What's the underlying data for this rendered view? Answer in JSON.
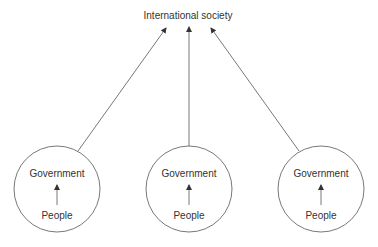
{
  "diagram": {
    "top_node": {
      "label": "International society"
    },
    "nodes": [
      {
        "government_label": "Government",
        "people_label": "People"
      },
      {
        "government_label": "Government",
        "people_label": "People"
      },
      {
        "government_label": "Government",
        "people_label": "People"
      }
    ],
    "colors": {
      "stroke": "#555555",
      "text": "#333333",
      "background": "#ffffff"
    }
  }
}
